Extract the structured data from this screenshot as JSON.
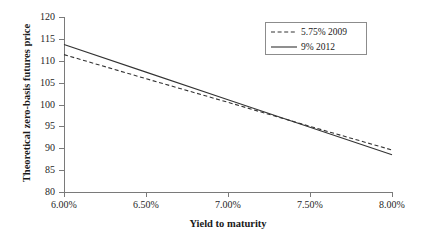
{
  "chart_data": {
    "type": "line",
    "title": "",
    "xlabel": "Yield to maturity",
    "ylabel": "Theoretical zero-basis futures price",
    "xlim": [
      6.0,
      8.0
    ],
    "ylim": [
      80,
      120
    ],
    "grid": false,
    "legend_position": "top-right",
    "x_tick_labels": [
      "6.00%",
      "6.50%",
      "7.00%",
      "7.50%",
      "8.00%"
    ],
    "x_tick_values": [
      6.0,
      6.5,
      7.0,
      7.5,
      8.0
    ],
    "y_tick_labels": [
      "80",
      "85",
      "90",
      "95",
      "100",
      "105",
      "110",
      "115",
      "120"
    ],
    "y_tick_values": [
      80,
      85,
      90,
      95,
      100,
      105,
      110,
      115,
      120
    ],
    "series": [
      {
        "name": "5.75% 2009",
        "style": "dashed",
        "color": "#333333",
        "x": [
          6.0,
          6.5,
          7.0,
          7.5,
          8.0
        ],
        "values": [
          111.4,
          105.9,
          100.5,
          95.0,
          89.6
        ]
      },
      {
        "name": "9% 2012",
        "style": "solid",
        "color": "#333333",
        "x": [
          6.0,
          6.5,
          7.0,
          7.5,
          8.0
        ],
        "values": [
          113.7,
          107.4,
          101.1,
          94.8,
          88.5
        ]
      }
    ]
  },
  "legend": {
    "entries": [
      {
        "label": "5.75% 2009"
      },
      {
        "label": "9% 2012"
      }
    ]
  }
}
